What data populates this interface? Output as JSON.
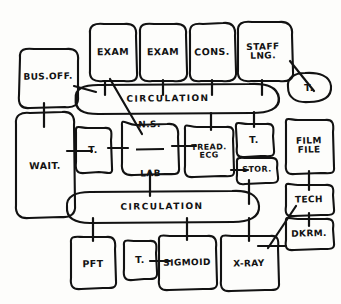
{
  "diagram": {
    "style": "hand-drawn ink sketch",
    "background_color": "#fdfdfb",
    "ink_color": "#121212",
    "width": 341,
    "height": 304,
    "nodes": [
      {
        "id": "bus_off",
        "label": "BUS.OFF.",
        "shape": "rounded-rect",
        "x": 48,
        "y": 76,
        "w": 62,
        "h": 54
      },
      {
        "id": "exam_1",
        "label": "EXAM",
        "shape": "rounded-rect",
        "x": 113,
        "y": 52,
        "w": 48,
        "h": 58
      },
      {
        "id": "exam_2",
        "label": "EXAM",
        "shape": "rounded-rect",
        "x": 163,
        "y": 52,
        "w": 48,
        "h": 58
      },
      {
        "id": "cons",
        "label": "CONS.",
        "shape": "rounded-rect",
        "x": 212,
        "y": 52,
        "w": 48,
        "h": 58
      },
      {
        "id": "staff_lng",
        "label": "STAFF\nLNG.",
        "shape": "rounded-rect",
        "x": 264,
        "y": 52,
        "w": 56,
        "h": 58
      },
      {
        "id": "t_top",
        "label": "T.",
        "shape": "bubble",
        "x": 308,
        "y": 87,
        "w": 46,
        "h": 30
      },
      {
        "id": "circ_top",
        "label": "CIRCULATION",
        "shape": "stadium",
        "x": 168,
        "y": 99,
        "w": 196,
        "h": 30
      },
      {
        "id": "wait",
        "label": "WAIT.",
        "shape": "rounded-rect",
        "x": 45,
        "y": 165,
        "w": 60,
        "h": 106
      },
      {
        "id": "t_left",
        "label": "T.",
        "shape": "rounded-rect",
        "x": 93,
        "y": 150,
        "w": 36,
        "h": 44
      },
      {
        "id": "ns_lab",
        "label": "N.S. / LAB",
        "shape": "rounded-rect",
        "x": 150,
        "y": 149,
        "w": 58,
        "h": 50,
        "numerator": "N.S.",
        "denominator": "LAB"
      },
      {
        "id": "tread_ecg",
        "label": "TREAD.\nECG",
        "shape": "rounded-rect",
        "x": 209,
        "y": 151,
        "w": 50,
        "h": 48
      },
      {
        "id": "t_mid",
        "label": "T.",
        "shape": "rounded-rect",
        "x": 254,
        "y": 140,
        "w": 38,
        "h": 32
      },
      {
        "id": "stor",
        "label": "STOR.",
        "shape": "rounded-rect",
        "x": 257,
        "y": 169,
        "w": 42,
        "h": 26
      },
      {
        "id": "film_file",
        "label": "FILM\nFILE",
        "shape": "rounded-rect",
        "x": 309,
        "y": 146,
        "w": 48,
        "h": 54
      },
      {
        "id": "tech",
        "label": "TECH",
        "shape": "rounded-rect",
        "x": 309,
        "y": 199,
        "w": 48,
        "h": 30
      },
      {
        "id": "dkrm",
        "label": "DKRM.",
        "shape": "rounded-rect",
        "x": 309,
        "y": 233,
        "w": 48,
        "h": 30
      },
      {
        "id": "circ_bot",
        "label": "CIRCULATION",
        "shape": "stadium",
        "x": 162,
        "y": 207,
        "w": 190,
        "h": 30
      },
      {
        "id": "pft",
        "label": "PFT",
        "shape": "rounded-rect",
        "x": 93,
        "y": 263,
        "w": 44,
        "h": 52
      },
      {
        "id": "t_bot",
        "label": "T.",
        "shape": "rounded-rect",
        "x": 139,
        "y": 259,
        "w": 32,
        "h": 38
      },
      {
        "id": "sigmoid",
        "label": "SIGMOID",
        "shape": "rounded-rect",
        "x": 187,
        "y": 262,
        "w": 56,
        "h": 52
      },
      {
        "id": "x_ray",
        "label": "X-RAY",
        "shape": "rounded-rect",
        "x": 249,
        "y": 263,
        "w": 56,
        "h": 54
      }
    ],
    "connections": [
      {
        "from": "bus_off",
        "to": "circ_top",
        "type": "tick"
      },
      {
        "from": "exam_1",
        "to": "circ_top",
        "type": "tick"
      },
      {
        "from": "exam_2",
        "to": "circ_top",
        "type": "tick"
      },
      {
        "from": "cons",
        "to": "circ_top",
        "type": "tick"
      },
      {
        "from": "staff_lng",
        "to": "circ_top",
        "type": "tick"
      },
      {
        "from": "staff_lng",
        "to": "t_top",
        "type": "diagonal"
      },
      {
        "from": "exam_1",
        "to": "ns_lab",
        "type": "diagonal"
      },
      {
        "from": "bus_off",
        "to": "wait",
        "type": "tick"
      },
      {
        "from": "wait",
        "to": "t_left",
        "type": "tick"
      },
      {
        "from": "t_left",
        "to": "ns_lab",
        "type": "tick"
      },
      {
        "from": "ns_lab",
        "to": "tread_ecg",
        "type": "tick"
      },
      {
        "from": "tread_ecg",
        "to": "stor",
        "type": "tick"
      },
      {
        "from": "circ_top",
        "to": "t_mid",
        "type": "tick"
      },
      {
        "from": "circ_top",
        "to": "tread_ecg",
        "type": "tick"
      },
      {
        "from": "ns_lab",
        "to": "circ_bot",
        "type": "tick"
      },
      {
        "from": "stor",
        "to": "circ_bot",
        "type": "tick"
      },
      {
        "from": "film_file",
        "to": "tech",
        "type": "tick"
      },
      {
        "from": "tech",
        "to": "dkrm",
        "type": "tick"
      },
      {
        "from": "tech",
        "to": "x_ray",
        "type": "diagonal"
      },
      {
        "from": "dkrm",
        "to": "x_ray",
        "type": "tick"
      },
      {
        "from": "circ_bot",
        "to": "pft",
        "type": "tick"
      },
      {
        "from": "circ_bot",
        "to": "sigmoid",
        "type": "tick"
      },
      {
        "from": "circ_bot",
        "to": "x_ray",
        "type": "tick"
      },
      {
        "from": "t_bot",
        "to": "sigmoid",
        "type": "tick"
      }
    ]
  }
}
